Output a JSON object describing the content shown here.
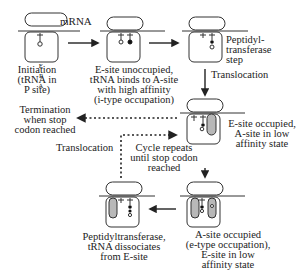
{
  "mrna_label": "mRNA",
  "site_labels": [
    "E",
    "P",
    "A"
  ],
  "states": [
    {
      "id": "initiation",
      "caption": "Initiation\n(tRNA in\nP site)"
    },
    {
      "id": "a-site-binding",
      "caption": "E-site unoccupied,\ntRNA binds to A-site\nwith high affinity\n(i-type occupation)"
    },
    {
      "id": "peptidyl-transferase",
      "caption": "Peptidyl-\ntransferase\nstep"
    },
    {
      "id": "e-site-occupied",
      "caption": "E-site occupied,\nA-site in low\naffinity state"
    },
    {
      "id": "a-site-occupied",
      "caption": "A-site occupied\n(e-type occupation),\nE-site in low\naffinity state"
    },
    {
      "id": "e-site-dissociation",
      "caption": "Peptidyltransferase,\ntRNA dissociates\nfrom E-site"
    }
  ],
  "arrows": {
    "translocation_1": "Translocation",
    "translocation_2": "Translocation",
    "termination": "Termination\nwhen stop\ncodon reached",
    "cycle": "Cycle repeats\nuntil stop codon\nreached"
  },
  "colors": {
    "stroke": "#333333",
    "shaded_trna": "#b8b8b8",
    "filled_dot": "#111111"
  }
}
